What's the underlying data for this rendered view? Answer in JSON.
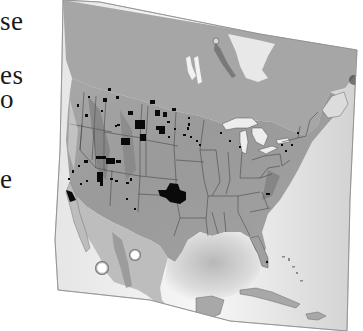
{
  "page": {
    "text_fragments": [
      {
        "text": "se",
        "top": 8
      },
      {
        "text": "es",
        "top": 62
      },
      {
        "text": "o",
        "top": 86
      },
      {
        "text": "e",
        "top": 166
      }
    ]
  },
  "map": {
    "title": "",
    "region": "North America (United States, southern Canada, northern Mexico, Gulf of Mexico, Caribbean)",
    "style": "grayscale shaded relief",
    "rotation_deg": 10,
    "colors": {
      "land": "#9c9c9c",
      "land_light": "#c4c4c4",
      "water_light": "#f2f2f2",
      "ocean_shade": "#bdbdbd",
      "state_lines": "#4a4a4a",
      "highlighted_areas": "#0a0a0a",
      "background": "#ffffff"
    },
    "features": {
      "state_boundaries": true,
      "great_lakes": true,
      "highlighted_areas_legend": "",
      "markers": [
        {
          "name": "bright-spot-west",
          "x": 102,
          "y": 268
        },
        {
          "name": "bright-spot-east",
          "x": 135,
          "y": 255
        }
      ]
    }
  }
}
